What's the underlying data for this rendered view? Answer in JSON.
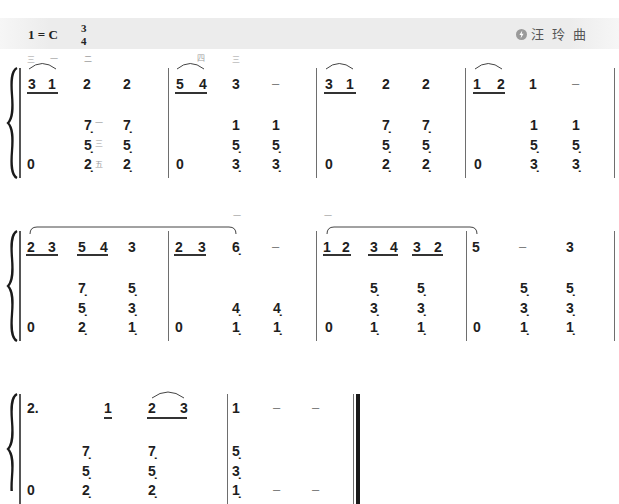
{
  "header": {
    "key": "1 = C",
    "time_top": "3",
    "time_bottom": "4",
    "composer_icon": "logo-icon",
    "composer": "汪 玲 曲"
  },
  "score": {
    "systems": [
      {
        "measures": [
          {
            "upper": [
              "3",
              "1",
              "2",
              "2"
            ],
            "upper_fingering": [
              "三",
              "一",
              "二"
            ],
            "lower": [
              [
                "0"
              ],
              [
                "7̣",
                "5̣",
                "2̣"
              ],
              [
                "7̣",
                "5̣",
                "2̣"
              ]
            ],
            "lower_fingering": [
              "一",
              "三",
              "五"
            ]
          },
          {
            "upper": [
              "5",
              "4",
              "3",
              "–"
            ],
            "upper_fingering": [
              "四",
              "三"
            ],
            "lower": [
              [
                "0"
              ],
              [
                "1",
                "5̣",
                "3̣"
              ],
              [
                "1",
                "5̣",
                "3̣"
              ]
            ]
          },
          {
            "upper": [
              "3",
              "1",
              "2",
              "2"
            ],
            "lower": [
              [
                "0"
              ],
              [
                "7̣",
                "5̣",
                "2̣"
              ],
              [
                "7̣",
                "5̣",
                "2̣"
              ]
            ]
          },
          {
            "upper": [
              "1",
              "2",
              "1",
              "–"
            ],
            "lower": [
              [
                "0"
              ],
              [
                "1",
                "5̣",
                "3̣"
              ],
              [
                "1",
                "5̣",
                "3̣"
              ]
            ]
          }
        ]
      },
      {
        "measures": [
          {
            "upper": [
              "2",
              "3",
              "5",
              "4",
              "3"
            ],
            "lower": [
              [
                "0"
              ],
              [
                "7̣",
                "5̣",
                "2̣"
              ],
              [
                "5̣",
                "3̣",
                "1̣"
              ]
            ]
          },
          {
            "upper": [
              "2",
              "3",
              "6̣",
              "–"
            ],
            "upper_fingering": [
              "一"
            ],
            "lower": [
              [
                "0"
              ],
              [
                "4̣",
                "1̣"
              ],
              [
                "4̣",
                "1̣"
              ]
            ]
          },
          {
            "upper": [
              "1",
              "2",
              "3",
              "4",
              "3",
              "2"
            ],
            "upper_fingering": [
              "一"
            ],
            "lower": [
              [
                "0"
              ],
              [
                "5̣",
                "3̣",
                "1̣"
              ],
              [
                "5̣",
                "3̣",
                "1̣"
              ]
            ]
          },
          {
            "upper": [
              "5",
              "–",
              "3"
            ],
            "lower": [
              [
                "0"
              ],
              [
                "5̣",
                "3̣",
                "1̣"
              ],
              [
                "5̣",
                "3̣",
                "1̣"
              ]
            ]
          }
        ]
      },
      {
        "measures": [
          {
            "upper": [
              "2.",
              "1",
              "2",
              "3"
            ],
            "lower": [
              [
                "0"
              ],
              [
                "7̣",
                "5̣",
                "2̣"
              ],
              [
                "7̣",
                "5̣",
                "2̣"
              ]
            ]
          },
          {
            "upper": [
              "1",
              "–",
              "–"
            ],
            "lower": [
              [
                "5̣",
                "3̣",
                "1̣"
              ],
              [
                "–"
              ],
              [
                "–"
              ]
            ]
          }
        ]
      }
    ]
  }
}
